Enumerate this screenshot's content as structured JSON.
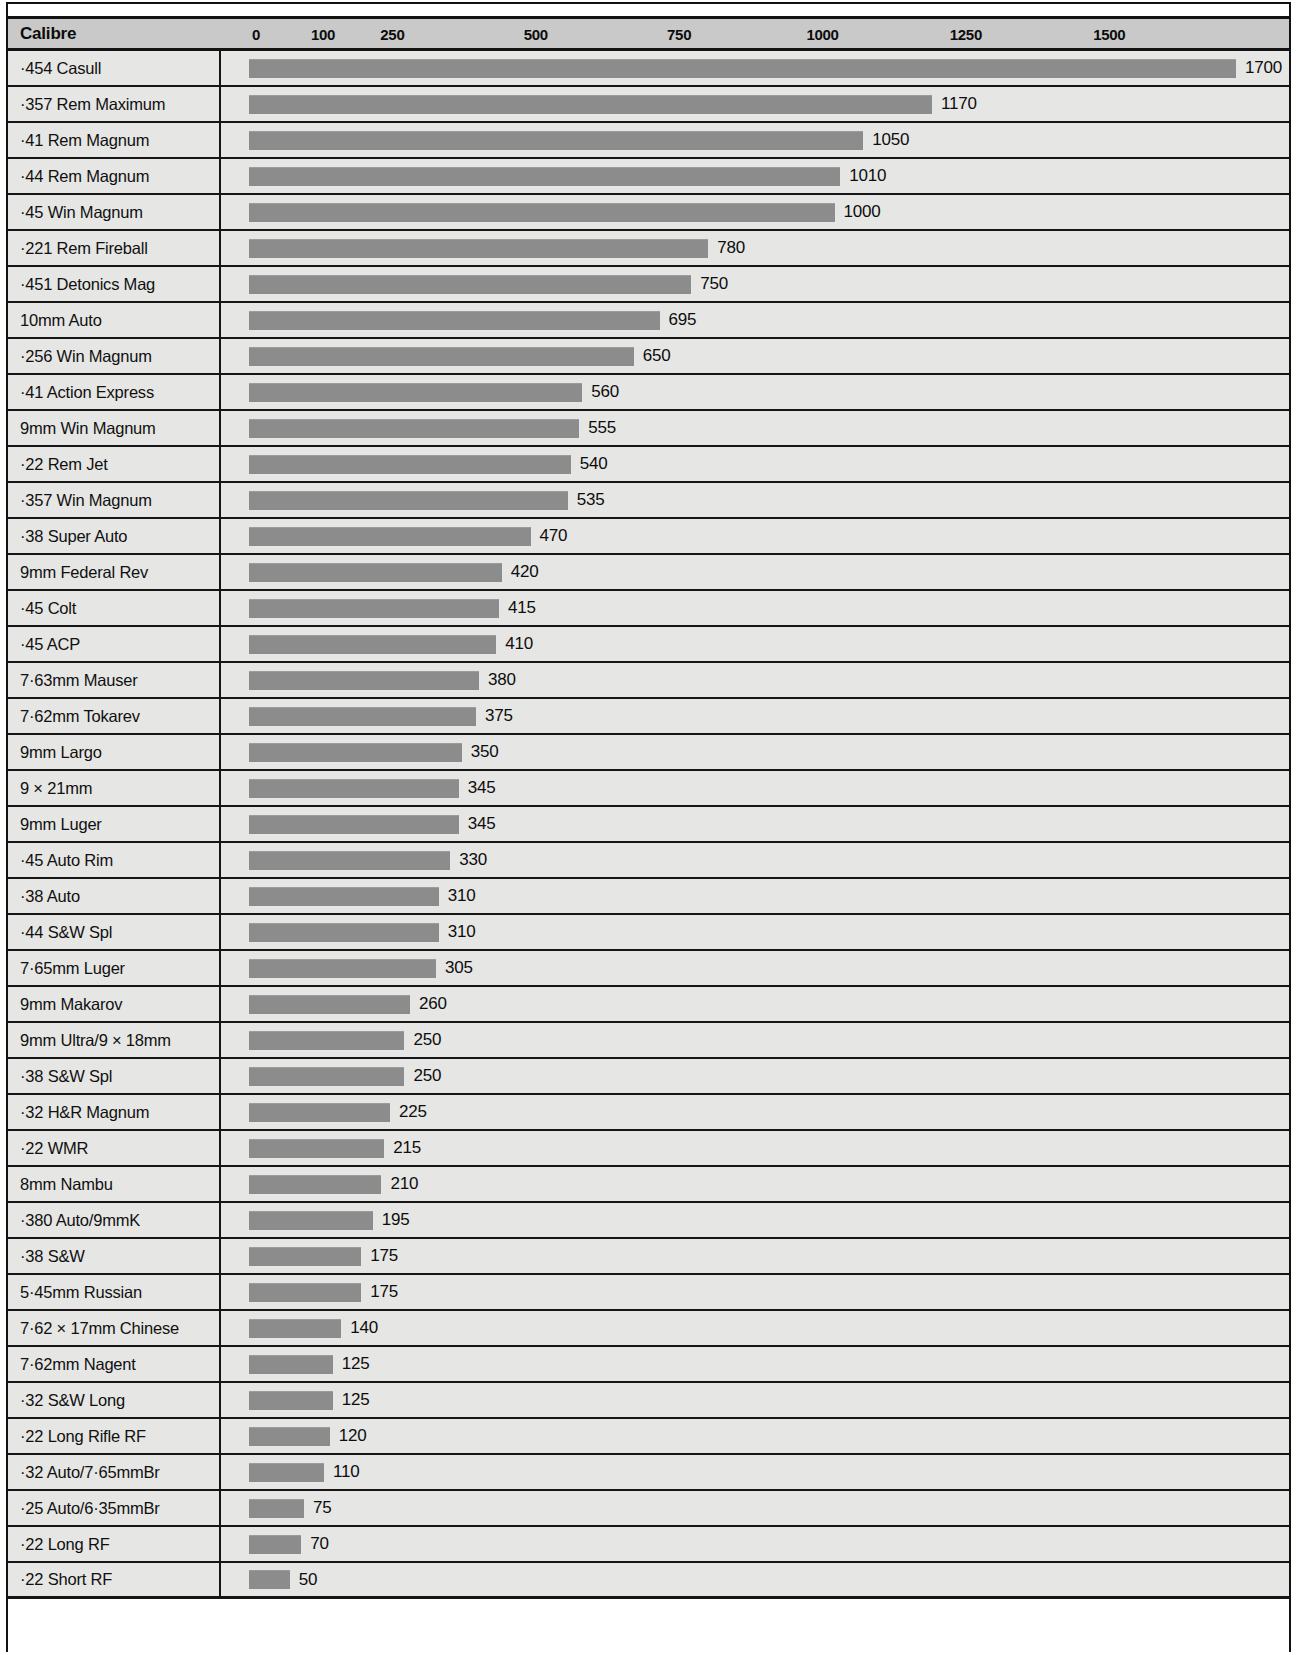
{
  "chart_data": {
    "type": "bar",
    "orientation": "horizontal",
    "title": "",
    "xlabel": "",
    "ylabel": "Calibre",
    "header": {
      "category_label": "Calibre"
    },
    "axis": {
      "ticks": [
        0,
        100,
        250,
        500,
        750,
        1000,
        1250,
        1500
      ],
      "tick_labels": [
        "0",
        "100",
        "250",
        "500",
        "750",
        "1000",
        "1250",
        "1500"
      ],
      "xlim": [
        0,
        1700
      ],
      "grid": false
    },
    "legend": null,
    "bar_color": "#8c8c8c",
    "header_color": "#c9c9c9",
    "row_color": "#e6e6e4",
    "categories": [
      "·454 Casull",
      "·357 Rem Maximum",
      "·41 Rem Magnum",
      "·44 Rem Magnum",
      "·45 Win Magnum",
      "·221 Rem Fireball",
      "·451 Detonics Mag",
      "10mm Auto",
      "·256 Win Magnum",
      "·41 Action Express",
      "9mm Win Magnum",
      "·22 Rem Jet",
      "·357 Win Magnum",
      "·38 Super Auto",
      "9mm Federal Rev",
      "·45 Colt",
      "·45 ACP",
      "7·63mm Mauser",
      "7·62mm Tokarev",
      "9mm Largo",
      "9 × 21mm",
      "9mm Luger",
      "·45 Auto Rim",
      "·38 Auto",
      "·44 S&W Spl",
      "7·65mm Luger",
      "9mm Makarov",
      "9mm Ultra/9 × 18mm",
      "·38 S&W Spl",
      "·32 H&R Magnum",
      "·22 WMR",
      "8mm Nambu",
      "·380 Auto/9mmK",
      "·38 S&W",
      "5·45mm Russian",
      "7·62 × 17mm Chinese",
      "7·62mm Nagent",
      "·32 S&W Long",
      "·22 Long Rifle RF",
      "·32 Auto/7·65mmBr",
      "·25 Auto/6·35mmBr",
      "·22 Long RF",
      "·22 Short RF"
    ],
    "values": [
      1700,
      1170,
      1050,
      1010,
      1000,
      780,
      750,
      695,
      650,
      560,
      555,
      540,
      535,
      470,
      420,
      415,
      410,
      380,
      375,
      350,
      345,
      345,
      330,
      310,
      310,
      305,
      260,
      250,
      250,
      225,
      215,
      210,
      195,
      175,
      175,
      140,
      125,
      125,
      120,
      110,
      75,
      70,
      50
    ],
    "value_labels": [
      "1700",
      "1170",
      "1050",
      "1010",
      "1000",
      "780",
      "750",
      "695",
      "650",
      "560",
      "555",
      "540",
      "535",
      "470",
      "420",
      "415",
      "410",
      "380",
      "375",
      "350",
      "345",
      "345",
      "330",
      "310",
      "310",
      "305",
      "260",
      "250",
      "250",
      "225",
      "215",
      "210",
      "195",
      "175",
      "175",
      "140",
      "125",
      "125",
      "120",
      "110",
      "75",
      "70",
      "50"
    ]
  }
}
